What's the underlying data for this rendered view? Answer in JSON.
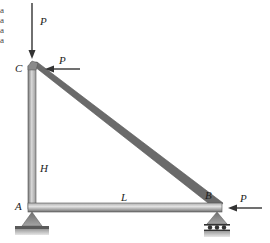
{
  "diagram": {
    "type": "truss-frame",
    "nodes": {
      "A": {
        "label": "A",
        "support": "pin"
      },
      "B": {
        "label": "B",
        "support": "roller"
      },
      "C": {
        "label": "C",
        "support": "none"
      }
    },
    "members": [
      {
        "id": "AC",
        "dimension_label": "H"
      },
      {
        "id": "AB",
        "dimension_label": "L"
      },
      {
        "id": "CB",
        "dimension_label": ""
      }
    ],
    "loads": [
      {
        "at": "C",
        "direction": "down",
        "label": "P"
      },
      {
        "at": "C",
        "direction": "left",
        "label": "P"
      },
      {
        "at": "B",
        "direction": "left",
        "label": "P"
      }
    ],
    "labels": {
      "C": "C",
      "A": "A",
      "B": "B",
      "H": "H",
      "L": "L",
      "P_top": "P",
      "P_c": "P",
      "P_b": "P"
    },
    "cropped_text_left_edge": [
      "a",
      "a",
      "a",
      "a"
    ],
    "colors": {
      "member_light": "#c8c8c8",
      "member_dark": "#6e6e6e",
      "arrow": "#333333",
      "support": "#8a8a8a",
      "ground": "#bdbdbd"
    }
  }
}
